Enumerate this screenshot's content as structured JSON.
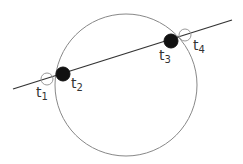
{
  "diagram": {
    "circle": {
      "cx": 126,
      "cy": 85,
      "r": 71,
      "stroke": "#888888"
    },
    "line": {
      "x1": 13,
      "y1": 89,
      "x2": 232,
      "y2": 20,
      "stroke": "#333333"
    },
    "points": [
      {
        "id": "t1",
        "label": "t",
        "sub": "1",
        "cx": 47,
        "cy": 79,
        "r": 6,
        "filled": false,
        "lx": 36,
        "ly": 97
      },
      {
        "id": "t2",
        "label": "t",
        "sub": "2",
        "cx": 63,
        "cy": 74,
        "r": 7,
        "filled": true,
        "lx": 71,
        "ly": 88
      },
      {
        "id": "t3",
        "label": "t",
        "sub": "3",
        "cx": 171,
        "cy": 41,
        "r": 7,
        "filled": true,
        "lx": 159,
        "ly": 60
      },
      {
        "id": "t4",
        "label": "t",
        "sub": "4",
        "cx": 185,
        "cy": 35,
        "r": 6,
        "filled": false,
        "lx": 193,
        "ly": 50
      }
    ]
  }
}
